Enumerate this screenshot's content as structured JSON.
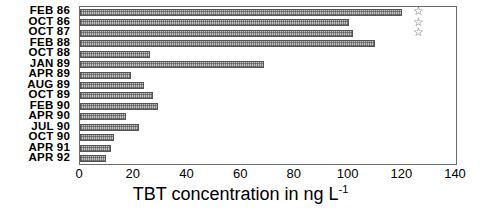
{
  "chart_data": {
    "type": "bar",
    "orientation": "horizontal",
    "title": "",
    "xlabel": "TBT concentration in ng L",
    "xlabel_exponent": "-1",
    "ylabel": "",
    "categories": [
      "FEB 86",
      "OCT 86",
      "OCT 87",
      "FEB 88",
      "OCT 88",
      "JAN 89",
      "APR 89",
      "AUG 89",
      "OCT 89",
      "FEB 90",
      "APR 90",
      "JUL 90",
      "OCT 90",
      "APR 91",
      "APR 92"
    ],
    "values": [
      120,
      100,
      101.5,
      110,
      26,
      68.5,
      19,
      24,
      27,
      29,
      17,
      22,
      12.5,
      11.5,
      9.5
    ],
    "xlim": [
      0,
      140
    ],
    "xticks": [
      0,
      20,
      40,
      60,
      80,
      100,
      120,
      140
    ],
    "xtick_labels": [
      "0",
      "20",
      "40",
      "60",
      "80",
      "100",
      "120",
      "140"
    ],
    "grid": false,
    "legend": null,
    "annotations": [
      {
        "symbol": "*",
        "glyph": "☆",
        "x": 124,
        "category": "FEB 86"
      },
      {
        "symbol": "*",
        "glyph": "☆",
        "x": 124,
        "category": "OCT 86"
      },
      {
        "symbol": "*",
        "glyph": "☆",
        "x": 124,
        "category": "OCT 87"
      }
    ],
    "bar_color": "#b9b9b9",
    "bar_edge_color": "#555555",
    "axis_color": "#6b6b6b"
  }
}
